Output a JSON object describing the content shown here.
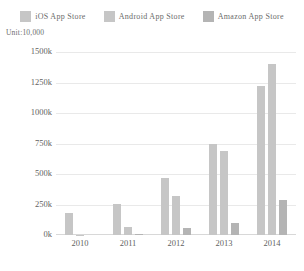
{
  "unit_caption": "Unit:10,000",
  "legend": {
    "position": "top-center",
    "items": [
      {
        "label": "iOS App Store",
        "color": "#c6c6c6",
        "swatch": "legend-swatch-ios"
      },
      {
        "label": "Android App Store",
        "color": "#c6c6c6",
        "swatch": "legend-swatch-android"
      },
      {
        "label": "Amazon App Store",
        "color": "#b4b4b4",
        "swatch": "legend-swatch-amazon"
      }
    ]
  },
  "chart_data": {
    "type": "bar",
    "title": "",
    "subtitle": "",
    "xlabel": "",
    "ylabel": "",
    "unit_note": "Unit:10,000",
    "categories": [
      "2010",
      "2011",
      "2012",
      "2013",
      "2014"
    ],
    "series": [
      {
        "name": "iOS App Store",
        "color": "#c6c6c6",
        "values": [
          180,
          255,
          470,
          745,
          1220
        ]
      },
      {
        "name": "Android App Store",
        "color": "#c6c6c6",
        "values": [
          3,
          65,
          320,
          690,
          1405
        ]
      },
      {
        "name": "Amazon App Store",
        "color": "#b4b4b4",
        "values": [
          0,
          5,
          55,
          100,
          290
        ]
      }
    ],
    "ylim": [
      0,
      1500
    ],
    "yticks": [
      0,
      250,
      500,
      750,
      1000,
      1250,
      1500
    ],
    "ytick_labels": [
      "0k",
      "250k",
      "500k",
      "750k",
      "1000k",
      "1250k",
      "1500k"
    ],
    "grid": true,
    "legend_position": "top-center"
  },
  "colors": {
    "grid": "#e9e9e9",
    "axis": "#d8d8d8",
    "text": "#5f5f5f",
    "background": "#ffffff"
  }
}
